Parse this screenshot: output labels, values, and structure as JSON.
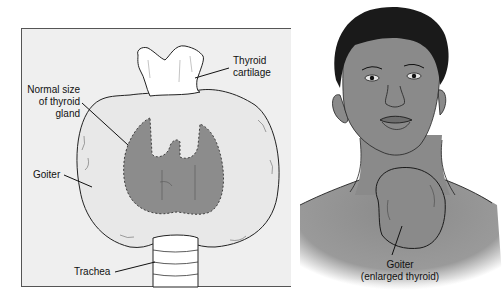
{
  "left_panel": {
    "labels": {
      "thyroid_cartilage": [
        "Thyroid",
        "cartilage"
      ],
      "normal_size": [
        "Normal size",
        "of thyroid",
        "gland"
      ],
      "goiter": "Goiter",
      "trachea": "Trachea"
    }
  },
  "right_panel": {
    "labels": {
      "goiter": [
        "Goiter",
        "(enlarged thyroid)"
      ]
    }
  },
  "colors": {
    "panel_bg": "#efefef",
    "gland_normal": "#8c8c8c",
    "goiter_fill": "#e6e6e6",
    "skin": "#8a8a8a",
    "hair": "#1a1a1a",
    "outline": "#222222"
  }
}
